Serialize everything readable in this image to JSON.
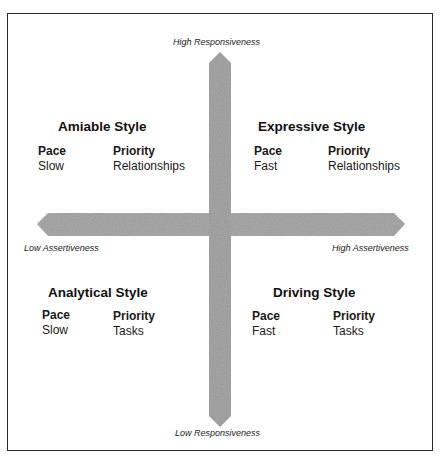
{
  "axes": {
    "top": "High Responsiveness",
    "bottom": "Low Responsiveness",
    "left": "Low Assertiveness",
    "right": "High Assertiveness"
  },
  "quadrants": {
    "amiable": {
      "title": "Amiable Style",
      "pace_label": "Pace",
      "pace": "Slow",
      "priority_label": "Priority",
      "priority": "Relationships"
    },
    "expressive": {
      "title": "Expressive Style",
      "pace_label": "Pace",
      "pace": "Fast",
      "priority_label": "Priority",
      "priority": "Relationships"
    },
    "analytical": {
      "title": "Analytical Style",
      "pace_label": "Pace",
      "pace": "Slow",
      "priority_label": "Priority",
      "priority": "Tasks"
    },
    "driving": {
      "title": "Driving Style",
      "pace_label": "Pace",
      "pace": "Fast",
      "priority_label": "Priority",
      "priority": "Tasks"
    }
  },
  "colors": {
    "arrow_fill": "#9a9a9a",
    "border": "#2a2a2a",
    "text": "#1a1a1a"
  }
}
